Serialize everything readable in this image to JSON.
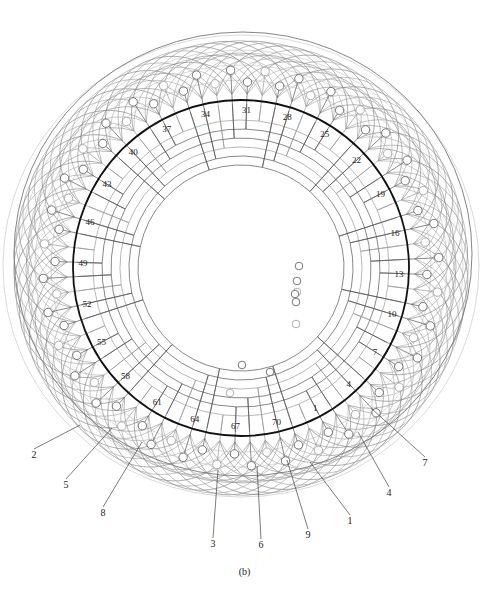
{
  "figure": {
    "caption": "(b)",
    "type": "winding-diagram",
    "center": [
      241,
      268
    ],
    "stator_circle_radius": 168,
    "slot_count": 72,
    "colors": {
      "stator_circle": "#111111",
      "winding_dark": "#555555",
      "winding_light": "#9a9a9a",
      "end_mesh": "#8a8a8a",
      "label": "#222222"
    },
    "slot_labels": [
      {
        "text": "1",
        "slot": 1
      },
      {
        "text": "4",
        "slot": 4
      },
      {
        "text": "7",
        "slot": 7
      },
      {
        "text": "10",
        "slot": 10
      },
      {
        "text": "13",
        "slot": 13
      },
      {
        "text": "16",
        "slot": 16
      },
      {
        "text": "19",
        "slot": 19
      },
      {
        "text": "22",
        "slot": 22
      },
      {
        "text": "25",
        "slot": 25
      },
      {
        "text": "28",
        "slot": 28
      },
      {
        "text": "31",
        "slot": 31
      },
      {
        "text": "34",
        "slot": 34
      },
      {
        "text": "37",
        "slot": 37
      },
      {
        "text": "40",
        "slot": 40
      },
      {
        "text": "43",
        "slot": 43
      },
      {
        "text": "46",
        "slot": 46
      },
      {
        "text": "49",
        "slot": 49
      },
      {
        "text": "52",
        "slot": 52
      },
      {
        "text": "55",
        "slot": 55
      },
      {
        "text": "58",
        "slot": 58
      },
      {
        "text": "61",
        "slot": 61
      },
      {
        "text": "64",
        "slot": 64
      },
      {
        "text": "67",
        "slot": 67
      },
      {
        "text": "70",
        "slot": 70
      }
    ],
    "callouts": [
      {
        "text": "1",
        "label_pos": [
          350,
          524
        ],
        "target": [
          310,
          462
        ]
      },
      {
        "text": "2",
        "label_pos": [
          34,
          458
        ],
        "target": [
          80,
          425
        ]
      },
      {
        "text": "3",
        "label_pos": [
          213,
          547
        ],
        "target": [
          218,
          470
        ]
      },
      {
        "text": "4",
        "label_pos": [
          389,
          496
        ],
        "target": [
          358,
          432
        ]
      },
      {
        "text": "5",
        "label_pos": [
          66,
          488
        ],
        "target": [
          112,
          428
        ]
      },
      {
        "text": "6",
        "label_pos": [
          261,
          548
        ],
        "target": [
          257,
          466
        ]
      },
      {
        "text": "7",
        "label_pos": [
          425,
          466
        ],
        "target": [
          372,
          409
        ]
      },
      {
        "text": "8",
        "label_pos": [
          103,
          516
        ],
        "target": [
          142,
          442
        ]
      },
      {
        "text": "9",
        "label_pos": [
          308,
          538
        ],
        "target": [
          287,
          460
        ]
      }
    ]
  }
}
